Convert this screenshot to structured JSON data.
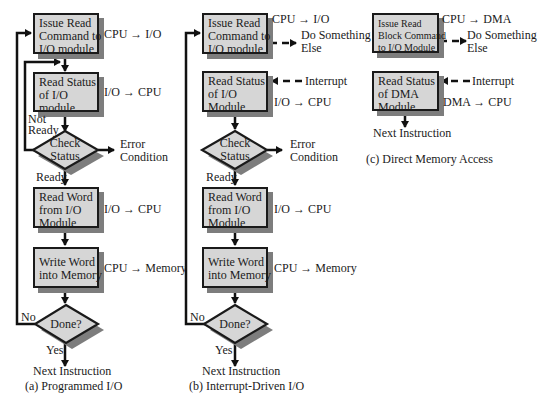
{
  "colors": {
    "box_fill": "#d6d6d6",
    "box_border": "#1a1a1a",
    "shadow": "#7d7d7d",
    "line": "#111111"
  },
  "panels": {
    "a": {
      "caption": "(a) Programmed I/O",
      "boxes": [
        {
          "lines": [
            "Issue Read",
            "Command to",
            "I/O module"
          ],
          "flow": "CPU → I/O"
        },
        {
          "lines": [
            "Read Status",
            "of I/O",
            "module"
          ],
          "flow": "I/O → CPU"
        },
        {
          "lines": [
            "Read Word",
            "from I/O",
            "Module"
          ],
          "flow": "I/O → CPU"
        },
        {
          "lines": [
            "Write Word",
            "into Memory"
          ],
          "flow": "CPU → Memory"
        }
      ],
      "check": {
        "lines": [
          "Check",
          "Status"
        ],
        "not_ready": [
          "Not",
          "Ready"
        ],
        "ready": "Ready",
        "error": [
          "Error",
          "Condition"
        ]
      },
      "done": {
        "label": "Done?",
        "no": "No",
        "yes": "Yes"
      },
      "next": "Next Instruction"
    },
    "b": {
      "caption": "(b) Interrupt-Driven I/O",
      "boxes": [
        {
          "lines": [
            "Issue Read",
            "Command to",
            "I/O module"
          ],
          "flow": "CPU → I/O"
        },
        {
          "lines": [
            "Read Status",
            "of I/O",
            "Module"
          ],
          "flow": "I/O → CPU"
        },
        {
          "lines": [
            "Read Word",
            "from I/O",
            "Module"
          ],
          "flow": "I/O → CPU"
        },
        {
          "lines": [
            "Write Word",
            "into Memory"
          ],
          "flow": "CPU → Memory"
        }
      ],
      "do_something": [
        "Do Something",
        "Else"
      ],
      "interrupt": "Interrupt",
      "check": {
        "lines": [
          "Check",
          "Status"
        ],
        "ready": "Ready",
        "error": [
          "Error",
          "Condition"
        ]
      },
      "done": {
        "label": "Done?",
        "no": "No",
        "yes": "Yes"
      },
      "next": "Next Instruction"
    },
    "c": {
      "caption": "(c) Direct Memory Access",
      "boxes": [
        {
          "lines": [
            "Issue Read",
            "Block Command",
            "to I/O Module"
          ],
          "flow": "CPU → DMA"
        },
        {
          "lines": [
            "Read Status",
            "of DMA",
            "Module"
          ],
          "flow": "DMA → CPU"
        }
      ],
      "do_something": [
        "Do Something",
        "Else"
      ],
      "interrupt": "Interrupt",
      "next": "Next Instruction"
    }
  }
}
